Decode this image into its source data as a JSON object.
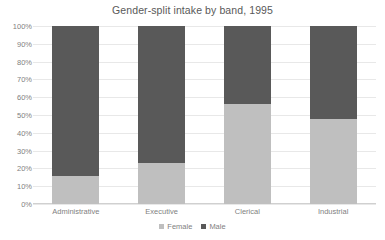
{
  "chart_data": {
    "type": "bar",
    "subtype": "100% stacked column",
    "title": "Gender-split intake by band, 1995",
    "subtitle": "",
    "xlabel": "",
    "ylabel": "",
    "categories": [
      "Administrative",
      "Executive",
      "Clerical",
      "Industrial"
    ],
    "series": [
      {
        "name": "Female",
        "values": [
          16,
          23,
          56,
          48
        ],
        "color": "#bfbfbf"
      },
      {
        "name": "Male",
        "values": [
          84,
          77,
          44,
          52
        ],
        "color": "#595959"
      }
    ],
    "ylim": [
      0,
      100
    ],
    "y_ticks": [
      0,
      10,
      20,
      30,
      40,
      50,
      60,
      70,
      80,
      90,
      100
    ],
    "y_tick_labels": [
      "0%",
      "10%",
      "20%",
      "30%",
      "40%",
      "50%",
      "60%",
      "70%",
      "80%",
      "90%",
      "100%"
    ],
    "grid": true,
    "grid_axis": "y",
    "legend": true,
    "legend_position": "bottom",
    "legend_entries": [
      "Female",
      "Male"
    ],
    "background_color": "#ffffff",
    "gridline_color": "#e8e8e8",
    "text_color": "#7f7f7f",
    "title_color": "#595959"
  }
}
